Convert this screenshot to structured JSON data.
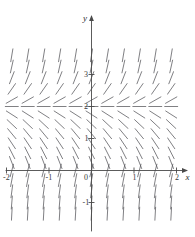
{
  "figure": {
    "kind": "slope-field",
    "title": "",
    "background": "#ffffff",
    "stroke_color": "#55555a",
    "axis_color": "#4a4a4a"
  },
  "chart_data": {
    "type": "scatter",
    "subtype": "slope-field",
    "title": "",
    "xlabel": "x",
    "ylabel": "y",
    "xlim": [
      -2.45,
      2.45
    ],
    "ylim": [
      -1.65,
      3.75
    ],
    "grid": false,
    "legend": null,
    "x_ticks": [
      -2,
      -1,
      0,
      1,
      2
    ],
    "x_tick_labels": [
      "-2",
      "-1",
      "0",
      "1",
      "2"
    ],
    "y_ticks": [
      -1,
      1,
      2,
      3
    ],
    "y_tick_labels": [
      "-1",
      "1",
      "2",
      "3"
    ],
    "origin_label": "0",
    "equilibrium_line_y": 2,
    "slope_rule": "dy/dx proportional to (y - 2)",
    "sample_x": [
      -2.25,
      -1.875,
      -1.5,
      -1.125,
      -0.75,
      -0.375,
      0,
      0.375,
      0.75,
      1.125,
      1.5,
      1.875,
      2.25
    ],
    "sample_y": [
      3.6,
      3.25,
      2.9,
      2.55,
      2.2,
      2.0,
      1.75,
      1.45,
      1.15,
      0.85,
      0.55,
      0.25,
      0.0,
      -0.3,
      -0.65,
      -1.0,
      -1.35
    ],
    "slopes_by_y": [
      {
        "y": 3.6,
        "slope": 8.0
      },
      {
        "y": 3.25,
        "slope": 6.0
      },
      {
        "y": 2.9,
        "slope": 3.4
      },
      {
        "y": 2.55,
        "slope": 1.9
      },
      {
        "y": 2.2,
        "slope": 0.75
      },
      {
        "y": 2.0,
        "slope": 0.0
      },
      {
        "y": 1.75,
        "slope": -0.85
      },
      {
        "y": 1.45,
        "slope": -1.25
      },
      {
        "y": 1.15,
        "slope": -1.6
      },
      {
        "y": 0.85,
        "slope": -2.0
      },
      {
        "y": 0.55,
        "slope": -2.6
      },
      {
        "y": 0.25,
        "slope": -3.4
      },
      {
        "y": 0.0,
        "slope": 5.0
      },
      {
        "y": -0.3,
        "slope": 7.0
      },
      {
        "y": -0.65,
        "slope": 10.0
      },
      {
        "y": -1.0,
        "slope": 16.0
      },
      {
        "y": -1.35,
        "slope": 24.0
      }
    ]
  },
  "axes": {
    "y_axis_name": "y",
    "x_axis_name": "x",
    "origin": "0"
  },
  "ticks": {
    "x": [
      {
        "label": "-2",
        "value": -2
      },
      {
        "label": "-1",
        "value": -1
      },
      {
        "label": "1",
        "value": 1
      },
      {
        "label": "2",
        "value": 2
      }
    ],
    "y": [
      {
        "label": "3",
        "value": 3
      },
      {
        "label": "2",
        "value": 2
      },
      {
        "label": "1",
        "value": 1
      },
      {
        "label": "-1",
        "value": -1
      }
    ]
  }
}
